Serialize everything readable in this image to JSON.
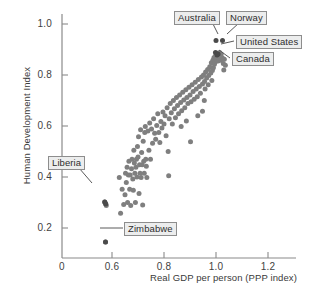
{
  "chart_data": {
    "type": "scatter",
    "title": "",
    "xlabel": "Real GDP per person (PPP index)",
    "ylabel": "Human Development Index",
    "xlim": [
      0.52,
      1.3
    ],
    "ylim": [
      0.1,
      1.04
    ],
    "xticks": [
      "0",
      "0.6",
      "0.8",
      "1.0",
      "1.2"
    ],
    "xtick_values": [
      0.52,
      0.6,
      0.8,
      1.0,
      1.2
    ],
    "yticks": [
      "0.2",
      "0.4",
      "0.6",
      "0.8",
      "1.0"
    ],
    "ytick_values": [
      0.2,
      0.4,
      0.6,
      0.8,
      1.0
    ],
    "grid": false,
    "legend": "none",
    "axis_break_note": "x axis origin 0 then jumps to 0.6",
    "point_color": "#7f7f7f",
    "highlight_color": "#4a4a4a",
    "marker_size_px": 5,
    "annotations": [
      {
        "label": "Australia",
        "x": 1.0,
        "y": 0.935
      },
      {
        "label": "Norway",
        "x": 1.025,
        "y": 0.935
      },
      {
        "label": "United States",
        "x": 1.0,
        "y": 0.885
      },
      {
        "label": "Canada",
        "x": 1.0,
        "y": 0.865
      },
      {
        "label": "Liberia",
        "x": 0.572,
        "y": 0.302
      },
      {
        "label": "Zimbabwe",
        "x": 0.575,
        "y": 0.145
      }
    ],
    "points": [
      [
        0.572,
        0.302
      ],
      [
        0.575,
        0.296
      ],
      [
        0.578,
        0.288
      ],
      [
        0.575,
        0.145
      ],
      [
        0.628,
        0.398
      ],
      [
        0.633,
        0.258
      ],
      [
        0.639,
        0.352
      ],
      [
        0.645,
        0.292
      ],
      [
        0.65,
        0.33
      ],
      [
        0.652,
        0.415
      ],
      [
        0.655,
        0.378
      ],
      [
        0.658,
        0.438
      ],
      [
        0.66,
        0.3
      ],
      [
        0.663,
        0.408
      ],
      [
        0.665,
        0.462
      ],
      [
        0.668,
        0.352
      ],
      [
        0.67,
        0.408
      ],
      [
        0.672,
        0.288
      ],
      [
        0.675,
        0.432
      ],
      [
        0.677,
        0.47
      ],
      [
        0.68,
        0.392
      ],
      [
        0.682,
        0.348
      ],
      [
        0.684,
        0.505
      ],
      [
        0.686,
        0.455
      ],
      [
        0.688,
        0.415
      ],
      [
        0.69,
        0.3
      ],
      [
        0.692,
        0.438
      ],
      [
        0.694,
        0.47
      ],
      [
        0.696,
        0.4
      ],
      [
        0.698,
        0.52
      ],
      [
        0.7,
        0.478
      ],
      [
        0.702,
        0.558
      ],
      [
        0.704,
        0.335
      ],
      [
        0.706,
        0.448
      ],
      [
        0.708,
        0.415
      ],
      [
        0.71,
        0.585
      ],
      [
        0.712,
        0.398
      ],
      [
        0.714,
        0.496
      ],
      [
        0.716,
        0.448
      ],
      [
        0.718,
        0.29
      ],
      [
        0.72,
        0.54
      ],
      [
        0.722,
        0.462
      ],
      [
        0.724,
        0.415
      ],
      [
        0.726,
        0.575
      ],
      [
        0.728,
        0.598
      ],
      [
        0.73,
        0.47
      ],
      [
        0.732,
        0.442
      ],
      [
        0.734,
        0.398
      ],
      [
        0.738,
        0.58
      ],
      [
        0.742,
        0.505
      ],
      [
        0.745,
        0.612
      ],
      [
        0.748,
        0.47
      ],
      [
        0.752,
        0.588
      ],
      [
        0.756,
        0.532
      ],
      [
        0.76,
        0.628
      ],
      [
        0.764,
        0.572
      ],
      [
        0.768,
        0.548
      ],
      [
        0.772,
        0.602
      ],
      [
        0.776,
        0.648
      ],
      [
        0.78,
        0.575
      ],
      [
        0.784,
        0.535
      ],
      [
        0.788,
        0.618
      ],
      [
        0.792,
        0.592
      ],
      [
        0.796,
        0.655
      ],
      [
        0.8,
        0.608
      ],
      [
        0.804,
        0.64
      ],
      [
        0.808,
        0.562
      ],
      [
        0.812,
        0.672
      ],
      [
        0.816,
        0.5
      ],
      [
        0.818,
        0.405
      ],
      [
        0.82,
        0.628
      ],
      [
        0.824,
        0.688
      ],
      [
        0.828,
        0.652
      ],
      [
        0.832,
        0.608
      ],
      [
        0.836,
        0.7
      ],
      [
        0.84,
        0.668
      ],
      [
        0.844,
        0.632
      ],
      [
        0.848,
        0.712
      ],
      [
        0.852,
        0.68
      ],
      [
        0.856,
        0.648
      ],
      [
        0.86,
        0.722
      ],
      [
        0.864,
        0.692
      ],
      [
        0.866,
        0.598
      ],
      [
        0.868,
        0.66
      ],
      [
        0.872,
        0.732
      ],
      [
        0.876,
        0.702
      ],
      [
        0.88,
        0.672
      ],
      [
        0.884,
        0.742
      ],
      [
        0.886,
        0.62
      ],
      [
        0.888,
        0.712
      ],
      [
        0.892,
        0.688
      ],
      [
        0.896,
        0.752
      ],
      [
        0.9,
        0.722
      ],
      [
        0.902,
        0.538
      ],
      [
        0.904,
        0.695
      ],
      [
        0.908,
        0.762
      ],
      [
        0.912,
        0.735
      ],
      [
        0.916,
        0.705
      ],
      [
        0.92,
        0.772
      ],
      [
        0.924,
        0.745
      ],
      [
        0.928,
        0.715
      ],
      [
        0.932,
        0.782
      ],
      [
        0.936,
        0.755
      ],
      [
        0.94,
        0.728
      ],
      [
        0.944,
        0.792
      ],
      [
        0.948,
        0.765
      ],
      [
        0.952,
        0.8
      ],
      [
        0.956,
        0.775
      ],
      [
        0.958,
        0.745
      ],
      [
        0.96,
        0.812
      ],
      [
        0.964,
        0.788
      ],
      [
        0.968,
        0.822
      ],
      [
        0.97,
        0.762
      ],
      [
        0.972,
        0.798
      ],
      [
        0.976,
        0.832
      ],
      [
        0.98,
        0.808
      ],
      [
        0.982,
        0.848
      ],
      [
        0.984,
        0.778
      ],
      [
        0.986,
        0.818
      ],
      [
        0.988,
        0.858
      ],
      [
        0.99,
        0.828
      ],
      [
        0.992,
        0.868
      ],
      [
        0.994,
        0.842
      ],
      [
        0.996,
        0.872
      ],
      [
        0.998,
        0.852
      ],
      [
        1.0,
        0.878
      ],
      [
        1.002,
        0.862
      ],
      [
        1.004,
        0.885
      ],
      [
        1.006,
        0.87
      ],
      [
        1.008,
        0.855
      ],
      [
        1.01,
        0.88
      ],
      [
        1.012,
        0.866
      ],
      [
        1.014,
        0.888
      ],
      [
        1.016,
        0.872
      ],
      [
        1.018,
        0.858
      ],
      [
        1.02,
        0.882
      ],
      [
        1.024,
        0.868
      ],
      [
        1.028,
        0.845
      ],
      [
        1.032,
        0.862
      ],
      [
        1.036,
        0.838
      ],
      [
        1.03,
        0.82
      ],
      [
        0.955,
        0.7
      ],
      [
        0.948,
        0.658
      ],
      [
        0.93,
        0.64
      ]
    ],
    "highlight_points": [
      [
        1.0,
        0.935
      ],
      [
        1.025,
        0.935
      ],
      [
        0.998,
        0.888
      ],
      [
        1.004,
        0.878
      ],
      [
        1.008,
        0.882
      ],
      [
        0.572,
        0.302
      ],
      [
        0.576,
        0.294
      ],
      [
        0.575,
        0.145
      ]
    ]
  },
  "axes": {
    "x_title": "Real GDP per person (PPP index)",
    "y_title": "Human Development Index"
  },
  "callouts": {
    "australia": "Australia",
    "norway": "Norway",
    "united_states": "United States",
    "canada": "Canada",
    "liberia": "Liberia",
    "zimbabwe": "Zimbabwe"
  },
  "ticks": {
    "x": [
      "0",
      "0.6",
      "0.8",
      "1.0",
      "1.2"
    ],
    "y": [
      "0.2",
      "0.4",
      "0.6",
      "0.8",
      "1.0"
    ]
  }
}
